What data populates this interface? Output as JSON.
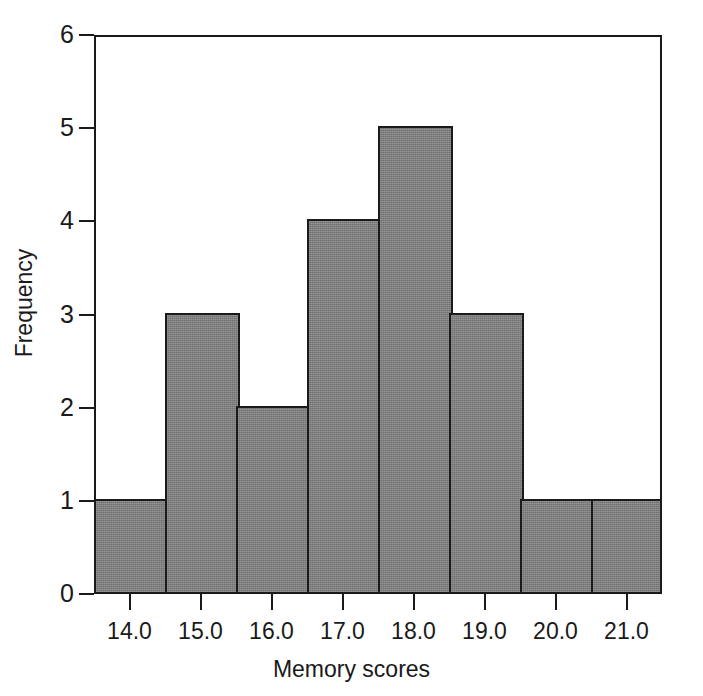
{
  "chart_data": {
    "type": "bar",
    "title": "",
    "subtitle": "",
    "xlabel": "Memory scores",
    "ylabel": "Frequency",
    "categories": [
      "13.5-14.5",
      "14.5-15.5",
      "15.5-16.5",
      "16.5-17.5",
      "17.5-18.5",
      "18.5-19.5",
      "19.5-20.5",
      "20.5-21.5"
    ],
    "bin_edges": [
      13.5,
      14.5,
      15.5,
      16.5,
      17.5,
      18.5,
      19.5,
      20.5,
      21.5
    ],
    "bin_centers": [
      14.0,
      15.0,
      16.0,
      17.0,
      18.0,
      19.0,
      20.0,
      21.0
    ],
    "values": [
      1,
      3,
      2,
      4,
      5,
      3,
      1,
      1
    ],
    "total_count": 20,
    "xlim": [
      13.5,
      21.5
    ],
    "ylim": [
      0,
      6
    ],
    "x_ticks": [
      14.0,
      15.0,
      16.0,
      17.0,
      18.0,
      19.0,
      20.0,
      21.0
    ],
    "x_tick_labels": [
      "14.0",
      "15.0",
      "16.0",
      "17.0",
      "18.0",
      "19.0",
      "20.0",
      "21.0"
    ],
    "y_ticks": [
      0,
      1,
      2,
      3,
      4,
      5,
      6
    ],
    "y_tick_labels": [
      "0",
      "1",
      "2",
      "3",
      "4",
      "5",
      "6"
    ],
    "grid": false,
    "legend": false,
    "legend_position": "none",
    "bar_fill_color": "#7e7e7e",
    "bar_edge_color": "#1a1a1a",
    "axis_color": "#1a1a1a",
    "background_color": "#ffffff"
  }
}
